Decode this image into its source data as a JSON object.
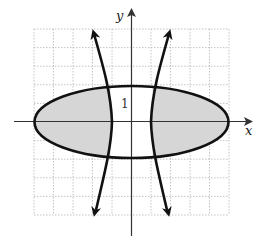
{
  "figure": {
    "axes": {
      "x_label": "x",
      "y_label": "y",
      "tick_label": "1",
      "x_range": [
        -5,
        5
      ],
      "y_range": [
        -5,
        5
      ],
      "grid": true,
      "grid_style": "dotted"
    },
    "curves": [
      {
        "name": "ellipse",
        "shape": "ellipse",
        "center": [
          0,
          0
        ],
        "semi_x": 5,
        "semi_y": 2
      },
      {
        "name": "hyperbola",
        "shape": "hyperbola",
        "orientation": "horizontal",
        "vertices": [
          [
            -1,
            0
          ],
          [
            1,
            0
          ]
        ],
        "arrows": true
      }
    ],
    "shaded_region": "inside ellipse and outside hyperbola branches",
    "colors": {
      "shade": "#d6d6d6",
      "curve": "#111111",
      "grid": "#b5b5b5",
      "axis": "#333333"
    }
  }
}
